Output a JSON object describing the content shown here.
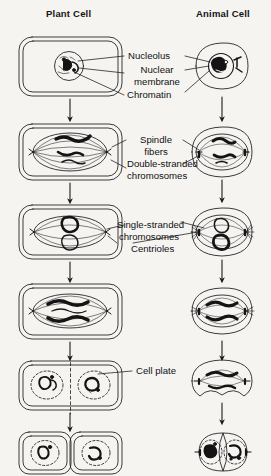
{
  "diagram": {
    "columns": [
      {
        "id": "plant",
        "header": "Plant Cell"
      },
      {
        "id": "animal",
        "header": "Animal Cell"
      }
    ],
    "labels": [
      {
        "id": "nucleolus",
        "text": "Nucleolus"
      },
      {
        "id": "nuclear-membrane-line1",
        "text": "Nuclear"
      },
      {
        "id": "nuclear-membrane-line2",
        "text": "membrane"
      },
      {
        "id": "chromatin",
        "text": "Chromatin"
      },
      {
        "id": "spindle-fibers-line1",
        "text": "Spindle"
      },
      {
        "id": "spindle-fibers-line2",
        "text": "fibers"
      },
      {
        "id": "double-stranded-line1",
        "text": "Double-stranded"
      },
      {
        "id": "double-stranded-line2",
        "text": "chromosomes"
      },
      {
        "id": "single-stranded-line1",
        "text": "Single-stranded"
      },
      {
        "id": "single-stranded-line2",
        "text": "chromosomes"
      },
      {
        "id": "centrioles",
        "text": "Centrioles"
      },
      {
        "id": "cell-plate",
        "text": "Cell plate"
      }
    ],
    "stages": [
      {
        "id": "interphase",
        "plant": "rounded rectangle cell with double wall, round nucleus containing nucleolus and chromatin",
        "animal": "oval cell with nucleus, nucleolus, chromatin and centriole pair"
      },
      {
        "id": "metaphase",
        "plant": "cell with spindle fibers and dark double-stranded chromosomes at equator",
        "animal": "oval cell with spindle, centrioles at poles, double-stranded chromosomes"
      },
      {
        "id": "early-anaphase",
        "plant": "cell with single-stranded chromosomes separating on spindle",
        "animal": "oval cell with asters, centrioles and separating chromosomes"
      },
      {
        "id": "late-anaphase",
        "plant": "cell with chromosome sets moving to opposite poles",
        "animal": "oval cell with chromosome sets at opposite poles"
      },
      {
        "id": "telophase",
        "plant": "cell forming cell plate down the middle, two nuclei reforming",
        "animal": "cell constricting with cleavage furrow, two nuclei reforming"
      },
      {
        "id": "daughter-cells",
        "plant": "two adjoining daughter cells each with a nucleus",
        "animal": "two daughter cells each with nucleus and centriole pair"
      }
    ]
  }
}
